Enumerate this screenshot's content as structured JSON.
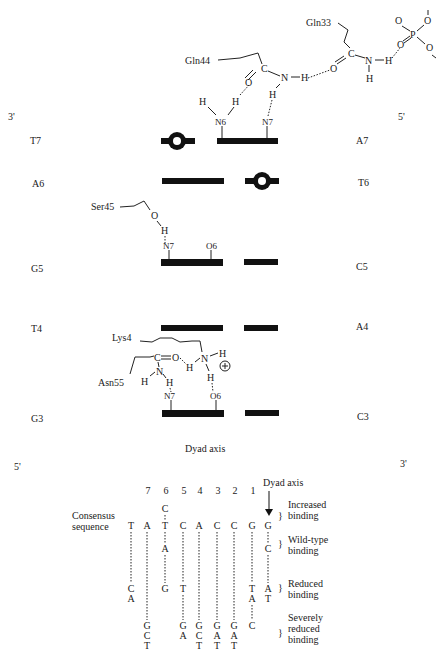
{
  "upper_panel": {
    "strand_ends": {
      "left_top": "3'",
      "right_top": "5'",
      "left_bottom": "5'",
      "right_bottom": "3'"
    },
    "base_pairs": [
      {
        "left": "T7",
        "right": "A7"
      },
      {
        "left": "A6",
        "right": "T6"
      },
      {
        "left": "G5",
        "right": "C5"
      },
      {
        "left": "T4",
        "right": "A4"
      },
      {
        "left": "G3",
        "right": "C3"
      }
    ],
    "residues": {
      "gln33": "Gln33",
      "gln44": "Gln44",
      "ser45": "Ser45",
      "lys4": "Lys4",
      "asn55": "Asn55"
    },
    "atoms": {
      "N6": "N6",
      "N7": "N7",
      "O6": "O6",
      "H": "H",
      "N": "N",
      "O": "O",
      "C": "C",
      "P": "P",
      "plus": "+"
    },
    "dyad_label": "Dyad axis"
  },
  "lower_panel": {
    "positions": [
      "7",
      "6",
      "5",
      "4",
      "3",
      "2",
      "1"
    ],
    "dyad_label": "Dyad axis",
    "consensus_label_1": "Consensus",
    "consensus_label_2": "sequence",
    "consensus": [
      "T",
      "A",
      "T",
      "C",
      "A",
      "C",
      "C",
      "G",
      "G"
    ],
    "increased": [
      "",
      "",
      "C",
      "",
      "",
      "",
      "",
      "",
      ""
    ],
    "wild_type": [
      "",
      "",
      "A",
      "",
      "",
      "",
      "",
      "",
      "C"
    ],
    "reduced": [
      "CA",
      "",
      "G",
      "T",
      "",
      "",
      "",
      "TA",
      "AT"
    ],
    "severe": [
      "",
      "GCT",
      "",
      "GA",
      "GCT",
      "GAT",
      "GAT",
      "C",
      ""
    ],
    "categories": {
      "increased": [
        "Increased",
        "binding"
      ],
      "wild_type": [
        "Wild-type",
        "binding"
      ],
      "reduced": [
        "Reduced",
        "binding"
      ],
      "severe": [
        "Severely",
        "reduced",
        "binding"
      ]
    },
    "brace": "}"
  }
}
